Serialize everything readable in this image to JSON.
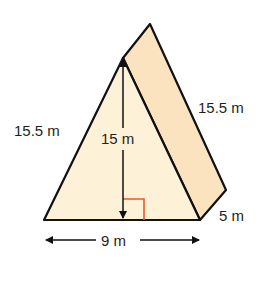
{
  "figure": {
    "type": "triangular-prism",
    "colors": {
      "front_face": "#fdf1d8",
      "side_face": "#fbe3bf",
      "stroke": "#111111",
      "right_angle_marker": "#e8592a"
    },
    "labels": {
      "left_slant": "15.5 m",
      "height": "15 m",
      "right_slant": "15.5 m",
      "depth": "5 m",
      "base": "9 m"
    }
  }
}
